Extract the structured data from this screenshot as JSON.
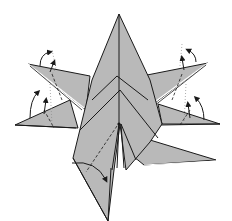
{
  "diagram": {
    "type": "origami-folding-step",
    "subject": "star-shaped origami model with six points",
    "colors": {
      "paper": "#b9b9b9",
      "paper_dark": "#a9a9a9",
      "outline": "#1a1a1a",
      "edge_highlight": "#ffffff",
      "background": "#ffffff",
      "guide": "#8a8a8a"
    },
    "parts": [
      {
        "id": "top-point",
        "description": "tall central point pointing up"
      },
      {
        "id": "upper-left-flap",
        "description": "flap pointing to upper-left with valley fold arrow"
      },
      {
        "id": "lower-left-flap",
        "description": "flap pointing to left with valley fold arrow"
      },
      {
        "id": "upper-right-flap",
        "description": "flap pointing to upper-right with valley fold arrow"
      },
      {
        "id": "lower-right-flap",
        "description": "flap pointing to right with valley fold arrow"
      },
      {
        "id": "bottom-left-point",
        "description": "long point extending down with fold line and arrow"
      },
      {
        "id": "bottom-right-point",
        "description": "point extending to lower right"
      }
    ],
    "annotations": [
      {
        "type": "fold-arrow",
        "location": "upper-left flap tip",
        "direction": "up"
      },
      {
        "type": "fold-arrow",
        "location": "lower-left flap tip",
        "direction": "up"
      },
      {
        "type": "fold-arrow",
        "location": "upper-right flap tip",
        "direction": "up"
      },
      {
        "type": "fold-arrow",
        "location": "lower-right flap tip",
        "direction": "up"
      },
      {
        "type": "fold-arrow",
        "location": "bottom-left point",
        "direction": "down-right"
      },
      {
        "type": "dashed-line",
        "location": "valley fold lines on each flap"
      },
      {
        "type": "dotted-line",
        "location": "vertical guide lines above flaps"
      }
    ]
  }
}
